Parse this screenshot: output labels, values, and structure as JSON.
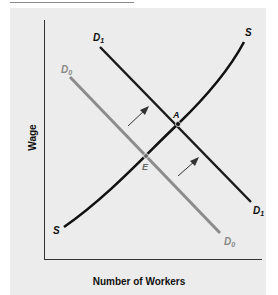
{
  "figure": {
    "x_axis_label": "Number of Workers",
    "y_axis_label": "Wage",
    "curves": {
      "supply": {
        "start_label": "S",
        "end_label": "S",
        "color": "#111111"
      },
      "demand_initial": {
        "start_label": "D0",
        "end_label": "D0",
        "color": "#8c8c8c"
      },
      "demand_new": {
        "start_label": "D1",
        "end_label": "D1",
        "color": "#1a1a1a"
      }
    },
    "points": {
      "initial_equilibrium": "E",
      "new_equilibrium": "A"
    },
    "colors": {
      "panel": "#ececec",
      "axis": "#333333"
    }
  }
}
